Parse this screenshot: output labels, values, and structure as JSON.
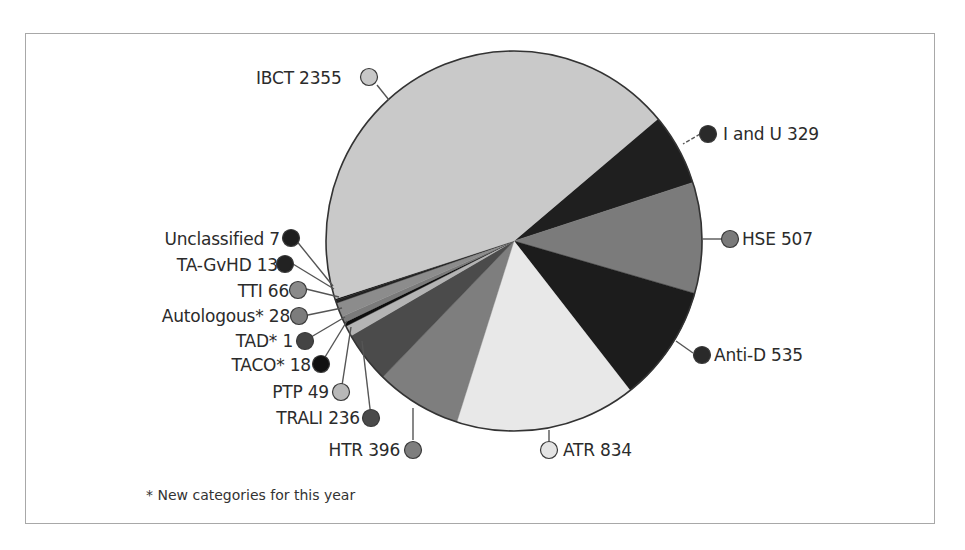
{
  "chart_data": {
    "type": "pie",
    "title": "",
    "start_angle_deg": -40,
    "direction": "clockwise",
    "slices": [
      {
        "label": "I and U",
        "value": 329,
        "color": "#1f1f1f",
        "marker_color": "#2a2a2a"
      },
      {
        "label": "HSE",
        "value": 507,
        "color": "#7b7b7b",
        "marker_color": "#7a7a7a"
      },
      {
        "label": "Anti-D",
        "value": 535,
        "color": "#1c1c1c",
        "marker_color": "#2a2a2a"
      },
      {
        "label": "ATR",
        "value": 834,
        "color": "#e8e8e8",
        "marker_color": "#e4e4e4"
      },
      {
        "label": "HTR",
        "value": 396,
        "color": "#7e7e7e",
        "marker_color": "#7e7e7e"
      },
      {
        "label": "TRALI",
        "value": 236,
        "color": "#4b4b4b",
        "marker_color": "#4a4a4a"
      },
      {
        "label": "PTP",
        "value": 49,
        "color": "#b4b4b4",
        "marker_color": "#b8b8b8"
      },
      {
        "label": "TACO*",
        "value": 18,
        "color": "#0e0e0e",
        "marker_color": "#111111"
      },
      {
        "label": "TAD*",
        "value": 1,
        "color": "#4a4a4a",
        "marker_color": "#444444"
      },
      {
        "label": "Autologous*",
        "value": 28,
        "color": "#7a7a7a",
        "marker_color": "#7c7c7c"
      },
      {
        "label": "TTI",
        "value": 66,
        "color": "#8c8c8c",
        "marker_color": "#8a8a8a"
      },
      {
        "label": "TA-GvHD",
        "value": 13,
        "color": "#222222",
        "marker_color": "#222222"
      },
      {
        "label": "Unclassified",
        "value": 7,
        "color": "#1a1a1a",
        "marker_color": "#1e1e1e"
      },
      {
        "label": "IBCT",
        "value": 2355,
        "color": "#c9c9c9",
        "marker_color": "#c8c8c8"
      }
    ],
    "total": 5374,
    "legend_position": "callout labels",
    "annotations": [
      "* New categories for this year"
    ]
  },
  "labels": {
    "ibct": "IBCT 2355",
    "i_and_u": "I and U 329",
    "hse": "HSE 507",
    "anti_d": "Anti-D 535",
    "atr": "ATR 834",
    "htr": "HTR 396",
    "trali": "TRALI 236",
    "ptp": "PTP 49",
    "taco": "TACO* 18",
    "tad": "TAD* 1",
    "autologous": "Autologous* 28",
    "tti": "TTI 66",
    "ta_gvhd": "TA-GvHD 13",
    "unclassified": "Unclassified 7"
  },
  "footnote": "* New categories for this year"
}
